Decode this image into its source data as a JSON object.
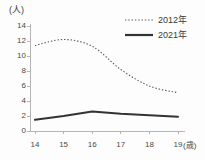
{
  "chart_data": {
    "type": "line",
    "title": "",
    "xlabel": "(歳)",
    "ylabel": "(人)",
    "x": [
      14,
      15,
      16,
      17,
      18,
      19
    ],
    "categories": [
      "14",
      "15",
      "16",
      "17",
      "18",
      "19"
    ],
    "series": [
      {
        "name": "2012年",
        "style": "dotted",
        "color": "#555555",
        "values": [
          11.4,
          12.2,
          11.3,
          8.2,
          6.0,
          5.1
        ]
      },
      {
        "name": "2021年",
        "style": "solid",
        "color": "#333333",
        "values": [
          1.5,
          2.0,
          2.6,
          2.3,
          2.1,
          1.9
        ]
      }
    ],
    "xlim": [
      14,
      19
    ],
    "ylim": [
      0,
      14
    ],
    "yticks": [
      0,
      2,
      4,
      6,
      8,
      10,
      12,
      14
    ],
    "ytick_labels": [
      "0",
      "2",
      "4",
      "6",
      "8",
      "10",
      "12",
      "14"
    ],
    "xticks": [
      14,
      15,
      16,
      17,
      18,
      19
    ],
    "xtick_labels": [
      "14",
      "15",
      "16",
      "17",
      "18",
      "19"
    ],
    "grid": false,
    "legend_position": "top-right",
    "axis_color": "#b4b4b4"
  },
  "axes": {
    "y_unit": "(人)",
    "x_unit": "(歳)"
  },
  "legend": {
    "entries": [
      {
        "label": "2012年",
        "swatch": "dotted-line-swatch"
      },
      {
        "label": "2021年",
        "swatch": "solid-line-swatch"
      }
    ]
  }
}
